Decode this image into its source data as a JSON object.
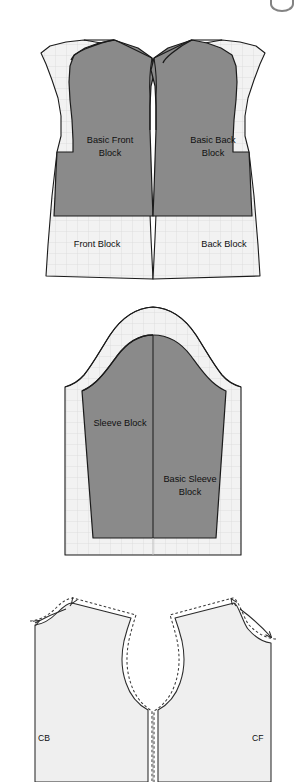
{
  "page": {
    "background_color": "#ffffff"
  },
  "palette": {
    "block_gray": "#8a8a8a",
    "block_gray_light": "#9a9a9a",
    "paper_light": "#f2f2f2",
    "grid_line": "#dcdcdc",
    "outline": "#1b1b1b",
    "dashed_line": "#444444",
    "label_text": "#101010"
  },
  "figures": [
    {
      "id": "bodice-blocks",
      "name": "Front and back bodice blocks",
      "labels": [
        {
          "id": "basic-front-block",
          "line1": "Basic Front",
          "line2": "Block"
        },
        {
          "id": "basic-back-block",
          "line1": "Basic Back",
          "line2": "Block"
        },
        {
          "id": "front-block",
          "line1": "Front Block",
          "line2": ""
        },
        {
          "id": "back-block",
          "line1": "Back Block",
          "line2": ""
        }
      ]
    },
    {
      "id": "sleeve-blocks",
      "name": "Sleeve blocks",
      "labels": [
        {
          "id": "sleeve-block",
          "line1": "Sleeve Block",
          "line2": ""
        },
        {
          "id": "basic-sleeve-block",
          "line1": "Basic Sleeve",
          "line2": "Block"
        }
      ]
    },
    {
      "id": "neckline-adjustment",
      "name": "Neckline and shoulder adjustment diagram",
      "labels": [
        {
          "id": "centre-back",
          "line1": "CB",
          "line2": ""
        },
        {
          "id": "centre-front",
          "line1": "CF",
          "line2": ""
        }
      ]
    }
  ],
  "bodice": {
    "basic_front_line1": "Basic Front",
    "basic_front_line2": "Block",
    "basic_back_line1": "Basic Back",
    "basic_back_line2": "Block",
    "front_block": "Front Block",
    "back_block": "Back Block"
  },
  "sleeve": {
    "sleeve_block": "Sleeve Block",
    "basic_sleeve_line1": "Basic Sleeve",
    "basic_sleeve_line2": "Block"
  },
  "neckline": {
    "cb": "CB",
    "cf": "CF"
  }
}
